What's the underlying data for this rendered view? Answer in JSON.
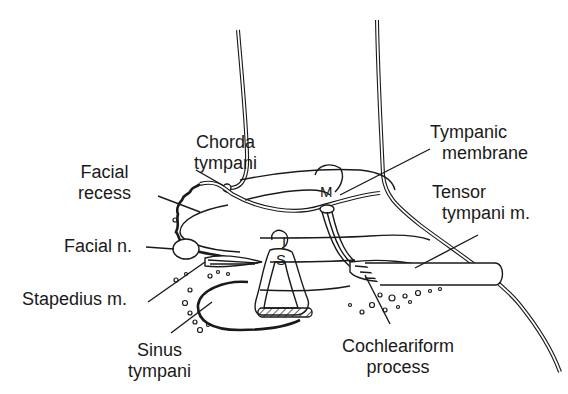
{
  "figure": {
    "type": "anatomical line drawing"
  },
  "labels": {
    "chorda_tympani": [
      "Chorda",
      "tympani"
    ],
    "facial_recess": [
      "Facial",
      "recess"
    ],
    "facial_n": "Facial n.",
    "stapedius_m": "Stapedius m.",
    "sinus_tympani": [
      "Sinus",
      "tympani"
    ],
    "tympanic_membrane": [
      "Tympanic",
      "membrane"
    ],
    "tensor_tympani_m": [
      "Tensor",
      "tympani m."
    ],
    "cochleariform_process": [
      "Cochleariform",
      "process"
    ]
  },
  "markers": {
    "malleus": "M",
    "incus": "I",
    "stapes": "S"
  },
  "colors": {
    "ink": "#1a1a1a",
    "background": "#ffffff"
  }
}
